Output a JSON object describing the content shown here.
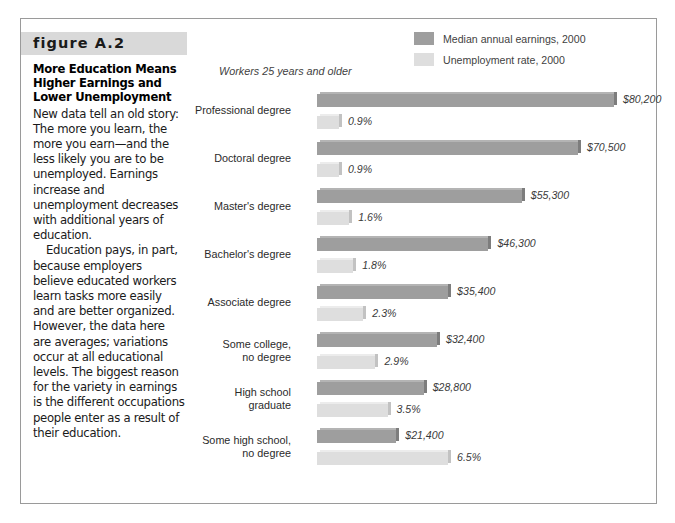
{
  "figure": {
    "number_label": "figure A.2",
    "title": "More Education Means Higher Earnings and Lower Unemployment",
    "paragraph_1": "New data tell an old story: The more you learn, the more you earn—and the less likely you are to be unemployed. Earnings increase and unemployment decreases with additional years of education.",
    "paragraph_2": "Education pays, in part, because employers believe educated workers learn tasks more easily and are better organized. However, the data here are averages; variations occur at all educational levels. The biggest reason for the variety in earnings is the different occupations people enter as a result of their education."
  },
  "colors": {
    "earnings_bar": "#9e9e9e",
    "unemployment_bar": "#dedede",
    "frame_border": "#9a9a9a",
    "figure_band": "#d9d9d9",
    "text": "#2b2b2b"
  },
  "chart_data": {
    "type": "bar",
    "orientation": "horizontal",
    "title": "More Education Means Higher Earnings and Lower Unemployment",
    "subtitle": "Workers 25 years and older",
    "xlabel": "",
    "ylabel": "",
    "grid": false,
    "legend_position": "top-right",
    "categories": [
      "Professional degree",
      "Doctoral degree",
      "Master's degree",
      "Bachelor's degree",
      "Associate degree",
      "Some college,\nno degree",
      "High school\ngraduate",
      "Some high school,\nno degree"
    ],
    "series": [
      {
        "name": "Median annual earnings, 2000",
        "unit": "USD",
        "color": "#9e9e9e",
        "values": [
          80200,
          70500,
          55300,
          46300,
          35400,
          32400,
          28800,
          21400
        ],
        "labels": [
          "$80,200",
          "$70,500",
          "$55,300",
          "$46,300",
          "$35,400",
          "$32,400",
          "$28,800",
          "$21,400"
        ],
        "max": 80200
      },
      {
        "name": "Unemployment rate, 2000",
        "unit": "percent",
        "color": "#dedede",
        "values": [
          0.9,
          0.9,
          1.6,
          1.8,
          2.3,
          2.9,
          3.5,
          6.5
        ],
        "labels": [
          "0.9%",
          "0.9%",
          "1.6%",
          "1.8%",
          "2.3%",
          "2.9%",
          "3.5%",
          "6.5%"
        ],
        "max": 6.5
      }
    ]
  }
}
